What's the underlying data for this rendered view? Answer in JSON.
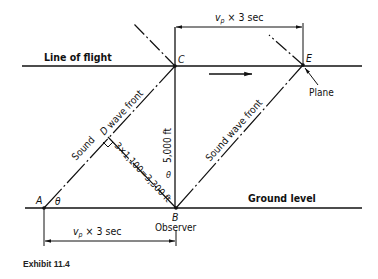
{
  "diagram": {
    "line_of_flight_label": "Line of flight",
    "ground_level_label": "Ground level",
    "points": {
      "A": "A",
      "B": "B",
      "C": "C",
      "D": "D",
      "E": "E"
    },
    "plane_label": "Plane",
    "observer_label": "Observer",
    "top_dimension_label": "vₚ × 3 sec",
    "top_dimension_v": "v",
    "top_dimension_sub": "p",
    "top_dimension_rest": " × 3 sec",
    "bottom_dimension_v": "v",
    "bottom_dimension_sub": "p",
    "bottom_dimension_rest": " × 3 sec",
    "altitude_label": "5,000 ft",
    "distance_label": "3×1,100=3,300 ft",
    "wave_front_left_label_1": "Sound",
    "wave_front_left_label_2": "wave front",
    "wave_front_right_label": "Sound wave front",
    "angle_at_A": "θ",
    "angle_at_B": "θ",
    "direction_arrow": "flight-direction-arrow"
  },
  "caption": "Exhibit 11.4"
}
